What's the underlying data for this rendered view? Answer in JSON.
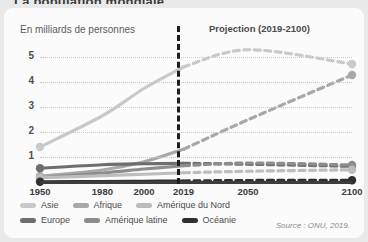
{
  "page": {
    "cut_title": "La population mondiale",
    "card_bg": "#fbfbfb"
  },
  "header": {
    "y_axis_caption": "En milliards de personnes",
    "projection_title": "Projection (2019-2100)"
  },
  "source": "Source : ONU, 2019.",
  "legend": {
    "row1": [
      {
        "label": "Asie",
        "color": "#c9c9c9"
      },
      {
        "label": "Afrique",
        "color": "#a8a8a8"
      },
      {
        "label": "Amérique du Nord",
        "color": "#bdbdbd"
      }
    ],
    "row2": [
      {
        "label": "Europe",
        "color": "#6e6e6e"
      },
      {
        "label": "Amérique latine",
        "color": "#8d8d8d"
      },
      {
        "label": "Océanie",
        "color": "#2f2f2f"
      }
    ]
  },
  "chart_data": {
    "type": "line",
    "title": "La population mondiale",
    "subtitle": "Projection (2019-2100)",
    "xlabel": "",
    "ylabel": "En milliards de personnes",
    "xlim": [
      1950,
      2100
    ],
    "ylim": [
      0,
      5.6
    ],
    "yticks": [
      1,
      2,
      3,
      4,
      5
    ],
    "xticks": [
      1950,
      1980,
      2000,
      2019,
      2050,
      2100
    ],
    "grid": true,
    "legend_position": "bottom-left",
    "projection_start": 2019,
    "annotations": [
      "Projection (2019-2100)"
    ],
    "x": [
      1950,
      1980,
      2000,
      2019,
      2050,
      2100
    ],
    "series": [
      {
        "name": "Asie",
        "color": "#c9c9c9",
        "values": [
          1.4,
          2.65,
          3.74,
          4.6,
          5.29,
          4.72
        ]
      },
      {
        "name": "Afrique",
        "color": "#a8a8a8",
        "values": [
          0.23,
          0.48,
          0.81,
          1.31,
          2.49,
          4.28
        ]
      },
      {
        "name": "Europe",
        "color": "#6e6e6e",
        "values": [
          0.55,
          0.69,
          0.73,
          0.75,
          0.71,
          0.63
        ]
      },
      {
        "name": "Amérique latine",
        "color": "#8d8d8d",
        "values": [
          0.17,
          0.36,
          0.52,
          0.65,
          0.76,
          0.68
        ]
      },
      {
        "name": "Amérique du Nord",
        "color": "#bdbdbd",
        "values": [
          0.17,
          0.25,
          0.31,
          0.37,
          0.43,
          0.49
        ]
      },
      {
        "name": "Océanie",
        "color": "#2f2f2f",
        "values": [
          0.01,
          0.02,
          0.03,
          0.04,
          0.06,
          0.07
        ]
      }
    ]
  }
}
